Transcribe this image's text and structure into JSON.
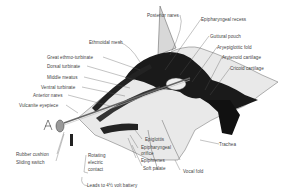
{
  "diagram": {
    "labels": {
      "posterior_nares": "Posterior nares",
      "epipharyngeal_recess": "Epipharyngeal recess",
      "ethmoidal_mesh": "Ethmoidal mesh",
      "guttural_pouch": "Guttural pouch",
      "aryepiglottic_fold": "Aryepiglottic fold",
      "arytenoid_cartilage": "Arytenoid cartilage",
      "cricoid_cartilage": "Cricoid cartilage",
      "great_ethmo_turbinate": "Great ethmo-turbinate",
      "dorsal_turbinate": "Dorsal turbinate",
      "middle_meatus": "Middle meatus",
      "ventral_turbinate": "Ventral turbinate",
      "anterior_nares": "Anterior nares",
      "vulcanite_eyepiece": "Vulcanite eyepiece",
      "rubber_cushion": "Rubber cushion",
      "sliding_switch": "Sliding switch",
      "rotating_electric_contact": [
        "Rotating",
        "electric",
        "contact"
      ],
      "epiglottis": "Epiglottis",
      "epipharyngeal_orifice": [
        "Epipharyngeal",
        "orifice"
      ],
      "epiphrenes": "Epiphrenes",
      "soft_palate": "Soft palate",
      "trachea": "Trachea",
      "vocal_fold": "Vocal fold",
      "battery_leads": "Leads to 4½ volt battery"
    }
  }
}
